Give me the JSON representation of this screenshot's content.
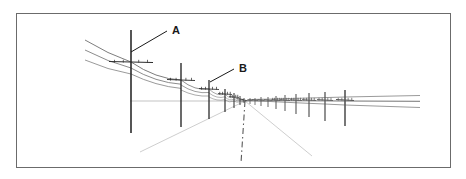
{
  "figure": {
    "background_color": "#ffffff",
    "border": {
      "name": "figure-frame",
      "x": 16,
      "y": 13,
      "width": 434,
      "height": 154,
      "stroke_color": "#6b6b6b",
      "stroke_width": 1
    },
    "horizon": {
      "name": "horizon-line",
      "x1": 130,
      "x2": 420,
      "y": 101,
      "stroke_color": "#b4b4b4",
      "stroke_width": 0.8
    },
    "vanishing_point": {
      "x": 245,
      "y": 101
    }
  },
  "labels": [
    {
      "id": "A",
      "text": "A",
      "x": 172,
      "y": 34,
      "leader": {
        "x1": 167,
        "y1": 31,
        "x2": 131,
        "y2": 52
      },
      "color": "#1a1a1a"
    },
    {
      "id": "B",
      "text": "B",
      "x": 239,
      "y": 72,
      "leader": {
        "x1": 234,
        "y1": 69,
        "x2": 210,
        "y2": 82
      },
      "color": "#1a1a1a"
    }
  ],
  "colors": {
    "ink_dark": "#2b2b2b",
    "ink_mid": "#555555",
    "ink_light": "#9a9a9a",
    "construction": "#c8c8c8",
    "frame": "#6b6b6b"
  },
  "poles": [
    {
      "name": "pole-1",
      "x": 131,
      "top": 30,
      "bottom": 133,
      "arm_y": 62,
      "arm_half": 22,
      "width": 1.6
    },
    {
      "name": "pole-2",
      "x": 181,
      "top": 63,
      "bottom": 127,
      "arm_y": 80,
      "arm_half": 14,
      "width": 1.4
    },
    {
      "name": "pole-3",
      "x": 209,
      "top": 80,
      "bottom": 119,
      "arm_y": 89,
      "arm_half": 10,
      "width": 1.3
    },
    {
      "name": "pole-4",
      "x": 225,
      "top": 89,
      "bottom": 112,
      "arm_y": 94,
      "arm_half": 7,
      "width": 1.2
    },
    {
      "name": "pole-5",
      "x": 234,
      "top": 93,
      "bottom": 108,
      "arm_y": 97,
      "arm_half": 5,
      "width": 1.0
    },
    {
      "name": "pole-6",
      "x": 240,
      "top": 96,
      "bottom": 105,
      "arm_y": 99,
      "arm_half": 3.5,
      "width": 0.9
    },
    {
      "name": "pole-7",
      "x": 244,
      "top": 98,
      "bottom": 103,
      "arm_y": 100,
      "arm_half": 2.5,
      "width": 0.8
    }
  ],
  "far_poles": [
    {
      "name": "far-pole-1",
      "x": 250,
      "top": 98,
      "bottom": 104,
      "arm_y": 100,
      "arm_half": 2.5,
      "width": 0.8
    },
    {
      "name": "far-pole-2",
      "x": 255,
      "top": 98,
      "bottom": 105,
      "arm_y": 100,
      "arm_half": 3,
      "width": 0.8
    },
    {
      "name": "far-pole-3",
      "x": 261,
      "top": 97,
      "bottom": 106,
      "arm_y": 100,
      "arm_half": 3.5,
      "width": 0.9
    },
    {
      "name": "far-pole-4",
      "x": 268,
      "top": 97,
      "bottom": 107,
      "arm_y": 100,
      "arm_half": 4,
      "width": 0.9
    },
    {
      "name": "far-pole-5",
      "x": 276,
      "top": 96,
      "bottom": 109,
      "arm_y": 100,
      "arm_half": 4.5,
      "width": 1.0
    },
    {
      "name": "far-pole-6",
      "x": 285,
      "top": 95,
      "bottom": 111,
      "arm_y": 100,
      "arm_half": 5,
      "width": 1.0
    },
    {
      "name": "far-pole-7",
      "x": 296,
      "top": 94,
      "bottom": 114,
      "arm_y": 100,
      "arm_half": 6,
      "width": 1.1
    },
    {
      "name": "far-pole-8",
      "x": 309,
      "top": 93,
      "bottom": 117,
      "arm_y": 100,
      "arm_half": 7,
      "width": 1.2
    },
    {
      "name": "far-pole-9",
      "x": 325,
      "top": 92,
      "bottom": 121,
      "arm_y": 100,
      "arm_half": 8,
      "width": 1.3
    },
    {
      "name": "far-pole-10",
      "x": 345,
      "top": 90,
      "bottom": 126,
      "arm_y": 100,
      "arm_half": 9,
      "width": 1.6
    }
  ],
  "wires": {
    "left_span_count": 3,
    "right_span_count": 3,
    "sag": 7,
    "stroke_color": "#6e6e6e"
  },
  "construction_lines": [
    {
      "name": "ground-ray-left",
      "x1": 245,
      "y1": 101,
      "x2": 140,
      "y2": 152
    },
    {
      "name": "ground-ray-right",
      "x1": 245,
      "y1": 101,
      "x2": 312,
      "y2": 156
    },
    {
      "name": "center-axis",
      "x1": 245,
      "y1": 101,
      "x2": 241,
      "y2": 163,
      "style": "dash-dot"
    }
  ]
}
